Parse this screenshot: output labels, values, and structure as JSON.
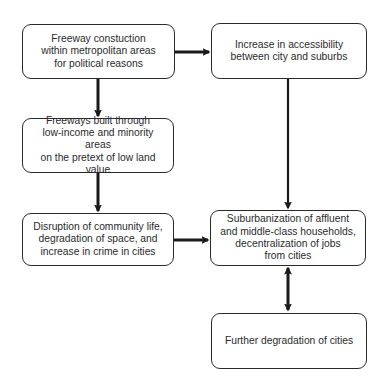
{
  "diagram": {
    "type": "flowchart",
    "colors": {
      "stroke": "#1a1a1a",
      "text": "#2b2b2b",
      "background": "#ffffff"
    },
    "nodes": [
      {
        "id": "n1",
        "text": "Freeway constuction\nwithin metropolitan areas\nfor political reasons"
      },
      {
        "id": "n2",
        "text": "Increase in accessibility\nbetween city and suburbs"
      },
      {
        "id": "n3",
        "text": "Freeways built through\nlow-income and minority areas\non the pretext of low land value"
      },
      {
        "id": "n4",
        "text": "Disruption of community life,\ndegradation of space, and\nincrease in crime in cities"
      },
      {
        "id": "n5",
        "text": "Suburbanization of affluent\nand middle-class households,\ndecentralization of jobs\nfrom cities"
      },
      {
        "id": "n6",
        "text": "Further degradation of cities"
      }
    ],
    "edges": [
      {
        "from": "n1",
        "to": "n2",
        "direction": "forward"
      },
      {
        "from": "n1",
        "to": "n3",
        "direction": "forward"
      },
      {
        "from": "n3",
        "to": "n4",
        "direction": "forward"
      },
      {
        "from": "n2",
        "to": "n5",
        "direction": "forward"
      },
      {
        "from": "n4",
        "to": "n5",
        "direction": "forward"
      },
      {
        "from": "n5",
        "to": "n6",
        "direction": "bidirectional"
      }
    ]
  }
}
